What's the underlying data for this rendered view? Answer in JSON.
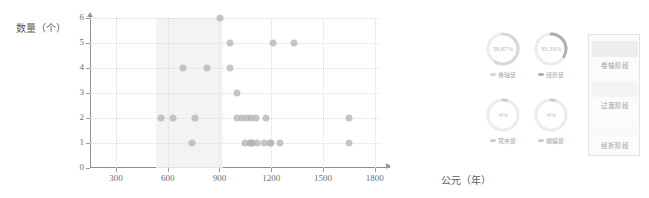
{
  "chart_data": {
    "type": "scatter",
    "title": "",
    "xlabel": "公元（年）",
    "ylabel": "数量（个）",
    "xlim": [
      150,
      1830
    ],
    "ylim": [
      0,
      6
    ],
    "xticks": [
      300,
      600,
      900,
      1200,
      1500,
      1800
    ],
    "yticks": [
      0,
      1,
      2,
      3,
      4,
      5,
      6
    ],
    "grid": "dotted",
    "legend_position": "right",
    "highlight_band": {
      "label": "过渡阶段",
      "x_start": 530,
      "x_end": 920
    },
    "points": [
      {
        "x": 560,
        "y": 2
      },
      {
        "x": 630,
        "y": 2
      },
      {
        "x": 690,
        "y": 4
      },
      {
        "x": 740,
        "y": 1
      },
      {
        "x": 760,
        "y": 2
      },
      {
        "x": 830,
        "y": 4
      },
      {
        "x": 905,
        "y": 6
      },
      {
        "x": 960,
        "y": 5
      },
      {
        "x": 960,
        "y": 4
      },
      {
        "x": 1000,
        "y": 2
      },
      {
        "x": 1000,
        "y": 3
      },
      {
        "x": 1030,
        "y": 2
      },
      {
        "x": 1050,
        "y": 1
      },
      {
        "x": 1060,
        "y": 2
      },
      {
        "x": 1075,
        "y": 1
      },
      {
        "x": 1080,
        "y": 1
      },
      {
        "x": 1085,
        "y": 2
      },
      {
        "x": 1090,
        "y": 1
      },
      {
        "x": 1110,
        "y": 2
      },
      {
        "x": 1120,
        "y": 1
      },
      {
        "x": 1160,
        "y": 1
      },
      {
        "x": 1170,
        "y": 2
      },
      {
        "x": 1195,
        "y": 1
      },
      {
        "x": 1200,
        "y": 1
      },
      {
        "x": 1250,
        "y": 1
      },
      {
        "x": 1210,
        "y": 5
      },
      {
        "x": 1330,
        "y": 5
      },
      {
        "x": 1650,
        "y": 2
      },
      {
        "x": 1650,
        "y": 1
      }
    ]
  },
  "gauges": [
    {
      "id": "gauge-juanzhouzhuang",
      "percent": "58.67%",
      "value": 58.67,
      "label": "卷轴装",
      "color": "#d8d8d8"
    },
    {
      "id": "gauge-jingzhezhuang",
      "percent": "33.33%",
      "value": 33.33,
      "label": "经折装",
      "color": "#b0b0b0"
    },
    {
      "id": "gauge-fanjiaben",
      "percent": "4%",
      "value": 4,
      "label": "梵夹装",
      "color": "#cfcfcf"
    },
    {
      "id": "gauge-hudiezhuang",
      "percent": "4%",
      "value": 4,
      "label": "蝴蝶装",
      "color": "#cfcfcf"
    }
  ],
  "stage_panel": {
    "title": "",
    "items": [
      {
        "label": "卷轴阶段",
        "color": "#ededed"
      },
      {
        "label": "过渡阶段",
        "color": "#f4f4f4"
      },
      {
        "label": "经折阶段",
        "color": "#fafafa"
      }
    ]
  }
}
